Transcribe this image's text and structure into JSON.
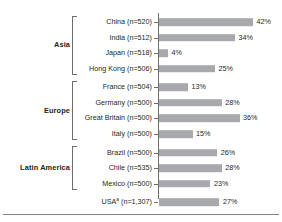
{
  "chart_data": {
    "type": "bar",
    "orientation": "horizontal",
    "title": "",
    "subtitle": "",
    "xlabel": "",
    "ylabel": "",
    "xlim": [
      0,
      42
    ],
    "grid": false,
    "legend": null,
    "value_suffix": "%",
    "groups": [
      {
        "name": "Asia",
        "bracketed": true,
        "rows": [
          {
            "label": "China (n=520)",
            "country": "China",
            "n": 520,
            "value": 42,
            "value_label": "42%"
          },
          {
            "label": "India (n=512)",
            "country": "India",
            "n": 512,
            "value": 34,
            "value_label": "34%"
          },
          {
            "label": "Japan (n=518)",
            "country": "Japan",
            "n": 518,
            "value": 4,
            "value_label": "4%"
          },
          {
            "label": "Hong Kong (n=506)",
            "country": "Hong Kong",
            "n": 506,
            "value": 25,
            "value_label": "25%"
          }
        ]
      },
      {
        "name": "Europe",
        "bracketed": true,
        "rows": [
          {
            "label": "France (n=504)",
            "country": "France",
            "n": 504,
            "value": 13,
            "value_label": "13%"
          },
          {
            "label": "Germany (n=500)",
            "country": "Germany",
            "n": 500,
            "value": 28,
            "value_label": "28%"
          },
          {
            "label": "Great Britain (n=500)",
            "country": "Great Britain",
            "n": 500,
            "value": 36,
            "value_label": "36%"
          },
          {
            "label": "Italy (n=500)",
            "country": "Italy",
            "n": 500,
            "value": 15,
            "value_label": "15%"
          }
        ]
      },
      {
        "name": "Latin America",
        "bracketed": true,
        "rows": [
          {
            "label": "Brazil (n=500)",
            "country": "Brazil",
            "n": 500,
            "value": 26,
            "value_label": "26%"
          },
          {
            "label": "Chile (n=535)",
            "country": "Chile",
            "n": 535,
            "value": 28,
            "value_label": "28%"
          },
          {
            "label": "Mexico (n=500)",
            "country": "Mexico",
            "n": 500,
            "value": 23,
            "value_label": "23%"
          }
        ]
      },
      {
        "name": "",
        "bracketed": false,
        "rows": [
          {
            "label": "USA",
            "label_sup": "a",
            "label_suffix": " (n=1,307)",
            "country": "USA",
            "n": 1307,
            "value": 27,
            "value_label": "27%"
          }
        ]
      }
    ]
  },
  "style": {
    "bar_color": "#a7a9ac",
    "axis_color": "#6d6e71",
    "text_color": "#231f20",
    "rule_color": "#808285",
    "background": "#ffffff"
  }
}
